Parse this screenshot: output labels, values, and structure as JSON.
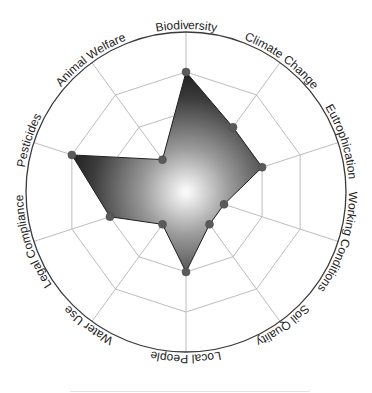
{
  "chart_data": {
    "type": "radar",
    "title": "",
    "categories": [
      "Biodiversity",
      "Climate Change",
      "Eutrophication",
      "Working Conditions",
      "Soil Quality",
      "Local People",
      "Water Use",
      "Legal Compliance",
      "Pesticides",
      "Animal Welfare"
    ],
    "series": [
      {
        "name": "score",
        "values": [
          3,
          2,
          2,
          1,
          1,
          2,
          1,
          2,
          3,
          1
        ]
      }
    ],
    "rlim": [
      0,
      4
    ],
    "ring_levels": [
      1,
      2,
      3,
      4
    ],
    "grid": true,
    "legend": "none",
    "colors": {
      "fill_center": "#ffffff",
      "fill_edge": "#1a1a1a",
      "point": "#5a5a5a",
      "grid": "#bdbdbd",
      "outer_ring": "#3a3a3a"
    }
  }
}
